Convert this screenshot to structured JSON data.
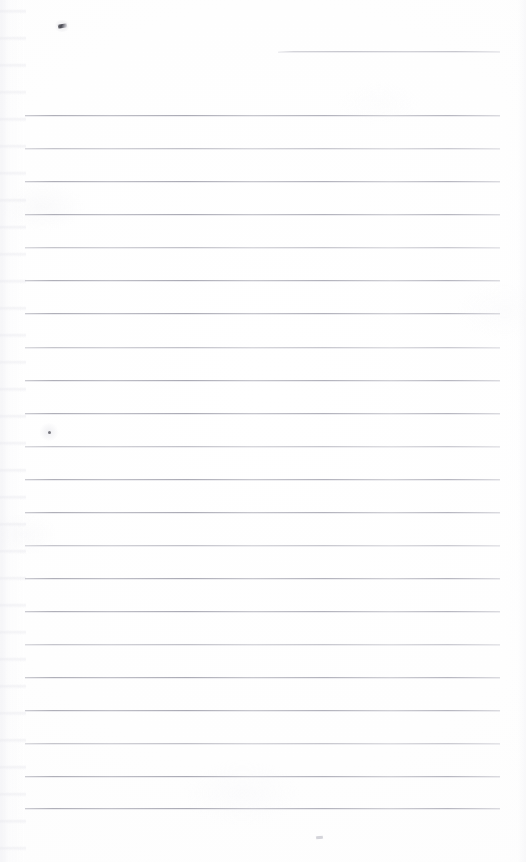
{
  "document": {
    "title": "Scanned ruled notebook page",
    "kind": "blank-lined-page",
    "width_px": 526,
    "height_px": 862,
    "page_background_color": "#fefefe",
    "rule_color": "#aeaeb8",
    "rule_thickness_px": 1,
    "text_content": "",
    "visible_text_lines": []
  },
  "ruling": {
    "full_rules_count": 22,
    "full_rule_left_px": 25,
    "full_rule_right_px": 500,
    "first_rule_y_px": 115,
    "rule_spacing_px": 33.05,
    "full_rule_y_positions": [
      115,
      148,
      181,
      214,
      247,
      280,
      313,
      347,
      380,
      413,
      446,
      479,
      512,
      545,
      578,
      611,
      644,
      677,
      710,
      743,
      776,
      808
    ],
    "short_rule": {
      "label": "short-top-right-rule",
      "y_px": 51,
      "left_px": 278,
      "right_px": 500
    }
  },
  "marks": [
    {
      "name": "top-smudge",
      "description": "small dark ink smudge near upper-left",
      "x_px": 58,
      "y_px": 24,
      "color": "#484850"
    },
    {
      "name": "mid-dot",
      "description": "faint pen dot above rule 10",
      "x_px": 48,
      "y_px": 431,
      "color": "#5c5c64"
    },
    {
      "name": "bottom-speck",
      "description": "very faint speck below last rule",
      "x_px": 316,
      "y_px": 836,
      "color": "#c4c4cc"
    }
  ]
}
